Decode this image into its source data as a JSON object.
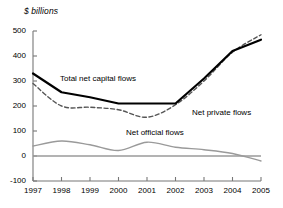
{
  "chart_data": {
    "type": "line",
    "title": "",
    "ylabel": "$ billions",
    "xlabel": "",
    "x": [
      1997,
      1998,
      1999,
      2000,
      2001,
      2002,
      2003,
      2004,
      2005
    ],
    "xticklabels": [
      "1997",
      "1998",
      "1999",
      "2000",
      "2001",
      "2002",
      "2003",
      "2004",
      "2005"
    ],
    "yticklabels": [
      "500",
      "400",
      "300",
      "200",
      "100",
      "0",
      "-100"
    ],
    "yticks": [
      500,
      400,
      300,
      200,
      100,
      0,
      -100
    ],
    "ylim": [
      -100,
      500
    ],
    "xlim": [
      1997,
      2005
    ],
    "grid": false,
    "legend_position": "inline-annotations",
    "zero_line": true,
    "series": [
      {
        "name": "Total net capital flows",
        "style": "solid",
        "color": "#000000",
        "width": 2.2,
        "values": [
          330,
          255,
          235,
          210,
          210,
          210,
          310,
          420,
          465
        ]
      },
      {
        "name": "Net private flows",
        "style": "dashed",
        "color": "#555555",
        "width": 1.4,
        "values": [
          290,
          200,
          195,
          185,
          155,
          205,
          300,
          415,
          485
        ]
      },
      {
        "name": "Net official flows",
        "style": "solid",
        "color": "#9a9a9a",
        "width": 1.3,
        "values": [
          40,
          60,
          45,
          22,
          55,
          35,
          25,
          10,
          -20
        ]
      }
    ],
    "annotations": [
      {
        "text": "Total net capital flows",
        "near": 1999,
        "value": 300
      },
      {
        "text": "Net private flows",
        "near": 2003,
        "value": 160
      },
      {
        "text": "Net official flows",
        "near": 2001,
        "value": 110
      }
    ]
  },
  "axis": {
    "unit_label": "$ billions",
    "y_ticks": [
      "500",
      "400",
      "300",
      "200",
      "100",
      "0",
      "-100"
    ],
    "x_ticks": [
      "1997",
      "1998",
      "1999",
      "2000",
      "2001",
      "2002",
      "2003",
      "2004",
      "2005"
    ]
  },
  "labels": {
    "total": "Total net capital flows",
    "private": "Net private flows",
    "official": "Net official flows"
  },
  "colors": {
    "total": "#000000",
    "private": "#555555",
    "official": "#9a9a9a",
    "axis": "#777777",
    "background": "#ffffff"
  }
}
